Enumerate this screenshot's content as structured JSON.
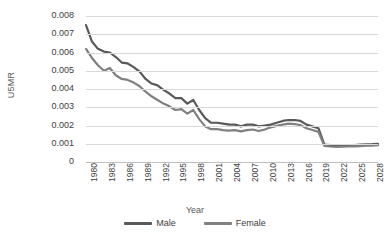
{
  "chart_data": {
    "type": "line",
    "title": "",
    "xlabel": "Year",
    "ylabel": "U5MR",
    "xlim": [
      1980,
      2029
    ],
    "ylim": [
      0,
      0.008
    ],
    "grid": true,
    "legend_position": "bottom",
    "ytick_labels": [
      "0.008",
      "0.007",
      "0.006",
      "0.005",
      "0.004",
      "0.003",
      "0.002",
      "0.001",
      "0"
    ],
    "ytick_values": [
      0.008,
      0.007,
      0.006,
      0.005,
      0.004,
      0.003,
      0.002,
      0.001,
      0
    ],
    "xtick_labels": [
      "1980",
      "1983",
      "1986",
      "1989",
      "1992",
      "1995",
      "1998",
      "2001",
      "2004",
      "2007",
      "2010",
      "2013",
      "2016",
      "2019",
      "2022",
      "2025",
      "2028"
    ],
    "xtick_values": [
      1980,
      1983,
      1986,
      1989,
      1992,
      1995,
      1998,
      2001,
      2004,
      2007,
      2010,
      2013,
      2016,
      2019,
      2022,
      2025,
      2028
    ],
    "x": [
      1980,
      1981,
      1982,
      1983,
      1984,
      1985,
      1986,
      1987,
      1988,
      1989,
      1990,
      1991,
      1992,
      1993,
      1994,
      1995,
      1996,
      1997,
      1998,
      1999,
      2000,
      2001,
      2002,
      2003,
      2004,
      2005,
      2006,
      2007,
      2008,
      2009,
      2010,
      2011,
      2012,
      2013,
      2014,
      2015,
      2016,
      2017,
      2018,
      2019,
      2020,
      2021,
      2022,
      2023,
      2024,
      2025,
      2026,
      2027,
      2028,
      2029
    ],
    "series": [
      {
        "name": "Male",
        "color": "#595959",
        "values": [
          0.0075,
          0.0066,
          0.0062,
          0.00605,
          0.006,
          0.00575,
          0.00545,
          0.0054,
          0.0052,
          0.00495,
          0.00455,
          0.0043,
          0.0042,
          0.00395,
          0.00375,
          0.0035,
          0.0035,
          0.0032,
          0.0034,
          0.00285,
          0.0024,
          0.00215,
          0.00215,
          0.0021,
          0.00205,
          0.00205,
          0.00195,
          0.00205,
          0.00205,
          0.00195,
          0.002,
          0.00205,
          0.00215,
          0.00225,
          0.0023,
          0.0023,
          0.00225,
          0.00205,
          0.00195,
          0.00185,
          0.00095,
          0.00092,
          0.0009,
          0.0009,
          0.00092,
          0.00093,
          0.00095,
          0.00097,
          0.00098,
          0.001
        ]
      },
      {
        "name": "Female",
        "color": "#808080",
        "values": [
          0.0062,
          0.0057,
          0.0053,
          0.005,
          0.00515,
          0.00475,
          0.00455,
          0.0045,
          0.00435,
          0.00415,
          0.00385,
          0.0036,
          0.0034,
          0.0032,
          0.00305,
          0.00285,
          0.0029,
          0.00265,
          0.00285,
          0.00235,
          0.00195,
          0.0018,
          0.0018,
          0.00175,
          0.00172,
          0.00175,
          0.00168,
          0.00175,
          0.00178,
          0.0017,
          0.00178,
          0.0019,
          0.00198,
          0.00205,
          0.0021,
          0.00208,
          0.00202,
          0.00185,
          0.00175,
          0.00165,
          0.00088,
          0.00085,
          0.00083,
          0.00084,
          0.00085,
          0.00086,
          0.00087,
          0.00089,
          0.0009,
          0.00092
        ]
      }
    ]
  }
}
